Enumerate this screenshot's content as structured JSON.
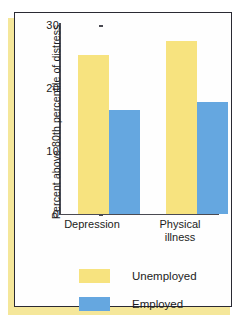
{
  "chart_data": {
    "type": "bar",
    "title": "",
    "xlabel": "",
    "ylabel": "Percent above 80th percentile of distress",
    "categories": [
      "Depression",
      "Physical illness"
    ],
    "category_lines": [
      [
        "Depression"
      ],
      [
        "Physical",
        "illness"
      ]
    ],
    "series": [
      {
        "name": "Unemployed",
        "color": "#f7e37f",
        "values": [
          25.3,
          27.5
        ]
      },
      {
        "name": "Employed",
        "color": "#65a7e0",
        "values": [
          16.5,
          17.8
        ]
      }
    ],
    "ylim": [
      0,
      30
    ],
    "yticks": [
      0,
      10,
      20,
      30
    ],
    "ytick_labels": [
      "0",
      "10",
      "20",
      "30"
    ],
    "grid": false,
    "legend_position": "bottom-center"
  },
  "legend": {
    "items": [
      {
        "label": "Unemployed",
        "color": "#f7e37f"
      },
      {
        "label": "Employed",
        "color": "#65a7e0"
      }
    ]
  },
  "colors": {
    "unemployed": "#f7e37f",
    "employed": "#65a7e0",
    "frame_border": "#2a2a33",
    "shadow": "#f5e79a",
    "axis": "#4a4a52",
    "text": "#1c1c22",
    "panel_background": "#fefefe"
  }
}
